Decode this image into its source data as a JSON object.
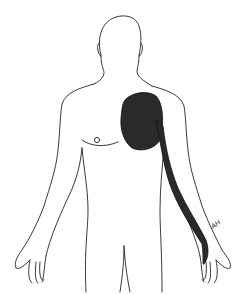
{
  "figure": {
    "annotation": {
      "region": "shaded area over left upper chest extending as a band down the left arm to the hand",
      "shade_color": "#2a2a2a"
    },
    "signature": "AH",
    "line_color": "#222222",
    "background": "#ffffff"
  }
}
